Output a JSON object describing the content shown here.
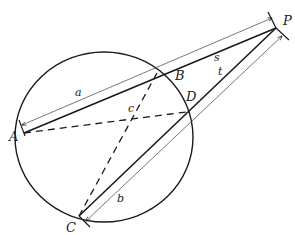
{
  "diagram": {
    "colors": {
      "stroke": "#1a1a1a",
      "thin": "#555555",
      "background": "#ffffff"
    },
    "circle": {
      "cx": 104,
      "cy": 137,
      "rx": 89,
      "ry": 85
    },
    "points": {
      "A": {
        "label": "A",
        "x": 24,
        "y": 133
      },
      "B": {
        "label": "B",
        "x": 157,
        "y": 73
      },
      "C": {
        "label": "C",
        "x": 79,
        "y": 216
      },
      "D": {
        "label": "D",
        "x": 186,
        "y": 112
      },
      "P": {
        "label": "P",
        "x": 276,
        "y": 28
      },
      "X": {
        "label": "c",
        "x": 136,
        "y": 121
      }
    },
    "segment_labels": {
      "a": "a",
      "b": "b",
      "c": "c",
      "s": "s",
      "t": "t"
    },
    "segments": [
      {
        "name": "secant-AP",
        "from": "A",
        "to": "P",
        "style": "solid"
      },
      {
        "name": "secant-CP",
        "from": "C",
        "to": "P",
        "style": "solid"
      },
      {
        "name": "chord-AD",
        "from": "A",
        "to": "D",
        "style": "dashed"
      },
      {
        "name": "chord-BC",
        "from": "B",
        "to": "C",
        "style": "dashed"
      }
    ],
    "dimension_arrows": [
      {
        "name": "length-a",
        "label": "a",
        "along": "A-P"
      },
      {
        "name": "length-b",
        "label": "b",
        "along": "C-P"
      }
    ]
  }
}
